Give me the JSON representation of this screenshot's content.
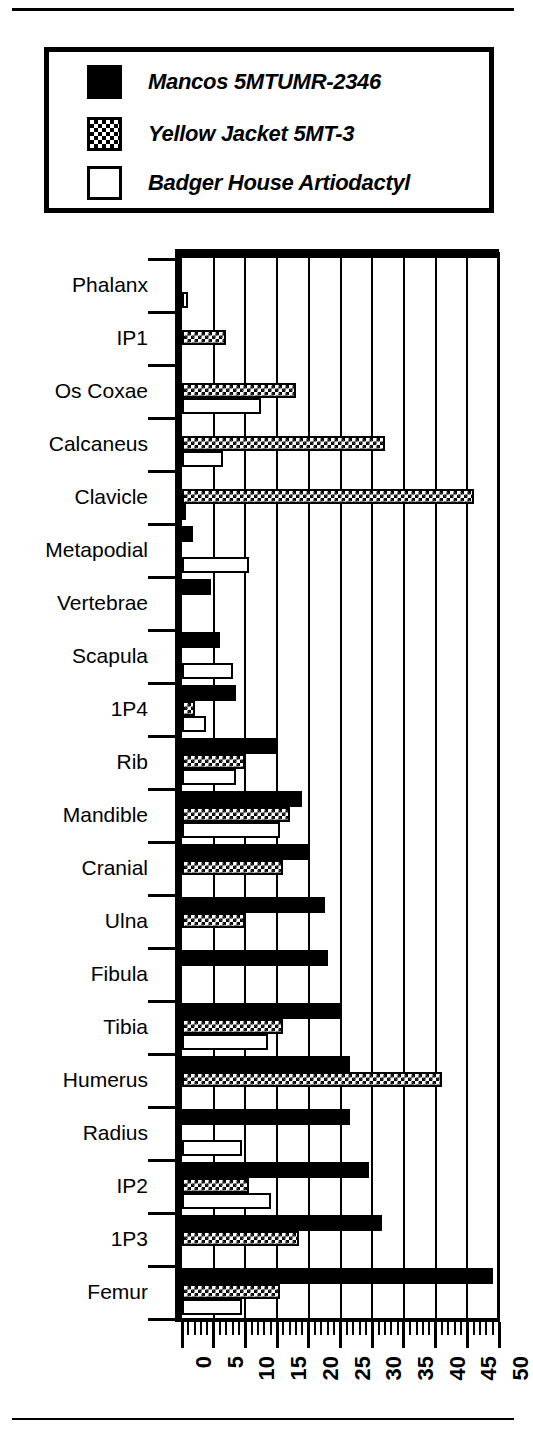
{
  "legend": {
    "entries": [
      {
        "label": "Mancos 5MTUMR-2346",
        "swatch": "solid-black-square-icon"
      },
      {
        "label": "Yellow Jacket 5MT-3",
        "swatch": "checkered-square-icon"
      },
      {
        "label": "Badger House Artiodactyl",
        "swatch": "white-square-icon"
      }
    ]
  },
  "chart_data": {
    "type": "bar",
    "orientation": "horizontal",
    "title": "",
    "xlabel": "",
    "ylabel": "",
    "xlim": [
      0,
      50
    ],
    "xticks": [
      0,
      5,
      10,
      15,
      20,
      25,
      30,
      35,
      40,
      45,
      50
    ],
    "xtick_labels": [
      "0",
      "5",
      "10",
      "15",
      "20",
      "25",
      "30",
      "35",
      "40",
      "45",
      "50"
    ],
    "minor_tick_interval": 1,
    "grid": "vertical",
    "legend_position": "top",
    "categories": [
      "Phalanx",
      "IP1",
      "Os Coxae",
      "Calcaneus",
      "Clavicle",
      "Metapodial",
      "Vertebrae",
      "Scapula",
      "1P4",
      "Rib",
      "Mandible",
      "Cranial",
      "Ulna",
      "Fibula",
      "Tibia",
      "Humerus",
      "Radius",
      "IP2",
      "1P3",
      "Femur"
    ],
    "series": [
      {
        "name": "Mancos 5MTUMR-2346",
        "fill": "solid-black",
        "values": [
          0,
          0,
          0,
          0,
          0,
          1.7,
          4.5,
          6,
          8.5,
          15,
          19,
          20,
          22.5,
          23,
          25,
          26.5,
          26.5,
          29.5,
          31.5,
          49
        ]
      },
      {
        "name": "Yellow Jacket 5MT-3",
        "fill": "checkered",
        "values": [
          0,
          7,
          18,
          32,
          46,
          0,
          0,
          0,
          2,
          10,
          17,
          16,
          10,
          0,
          16,
          41,
          0,
          10.5,
          18.5,
          15.5
        ]
      },
      {
        "name": "Badger House Artiodactyl",
        "fill": "white",
        "values": [
          1,
          0,
          12.5,
          6.5,
          0.7,
          10.5,
          0,
          8,
          3.8,
          8.5,
          15.5,
          0,
          0,
          0,
          13.5,
          0,
          9.5,
          14,
          0,
          9.5
        ]
      }
    ]
  }
}
